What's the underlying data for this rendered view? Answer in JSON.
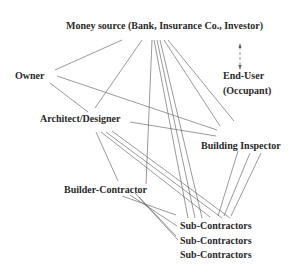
{
  "diagram": {
    "nodes": {
      "money_source": "Money source (Bank, Insurance Co., Investor)",
      "owner": "Owner",
      "end_user_line1": "End-User",
      "end_user_line2": "(Occupant)",
      "architect": "Architect/Designer",
      "building_inspector": "Building Inspector",
      "builder_contractor": "Builder-Contractor",
      "sub_contractors_1": "Sub-Contractors",
      "sub_contractors_2": "Sub-Contractors",
      "sub_contractors_3": "Sub-Contractors"
    },
    "edges": [
      {
        "from": "Money source",
        "to": "Owner"
      },
      {
        "from": "Money source",
        "to": "Architect/Designer"
      },
      {
        "from": "Money source",
        "to": "Builder-Contractor"
      },
      {
        "from": "Money source",
        "to": "Sub-Contractors"
      },
      {
        "from": "Money source",
        "to": "Sub-Contractors"
      },
      {
        "from": "Money source",
        "to": "Sub-Contractors"
      },
      {
        "from": "Money source",
        "to": "Building Inspector"
      },
      {
        "from": "Money source",
        "to": "Building Inspector"
      },
      {
        "from": "Money source",
        "to": "End-User (Occupant)",
        "style": "dashed-double-arrow"
      },
      {
        "from": "Owner",
        "to": "Architect/Designer"
      },
      {
        "from": "Owner",
        "to": "Building Inspector"
      },
      {
        "from": "Architect/Designer",
        "to": "Building Inspector"
      },
      {
        "from": "Architect/Designer",
        "to": "Builder-Contractor"
      },
      {
        "from": "Architect/Designer",
        "to": "Sub-Contractors"
      },
      {
        "from": "Architect/Designer",
        "to": "Sub-Contractors"
      },
      {
        "from": "Builder-Contractor",
        "to": "Sub-Contractors"
      },
      {
        "from": "Builder-Contractor",
        "to": "Sub-Contractors"
      },
      {
        "from": "Builder-Contractor",
        "to": "Sub-Contractors"
      },
      {
        "from": "Building Inspector",
        "to": "Sub-Contractors"
      },
      {
        "from": "Building Inspector",
        "to": "Sub-Contractors"
      },
      {
        "from": "Building Inspector",
        "to": "Sub-Contractors"
      }
    ],
    "colors": {
      "text": "#2a2a2a",
      "line": "#555555",
      "background": "#ffffff"
    }
  }
}
